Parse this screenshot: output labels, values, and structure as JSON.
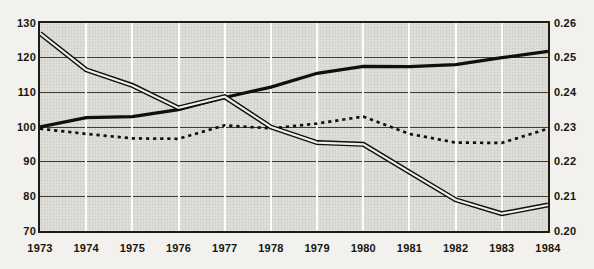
{
  "chart_data": {
    "type": "line",
    "title": "Nine small European countries",
    "title_footnote": "b",
    "x_labels": [
      "1973",
      "1974",
      "1975",
      "1976",
      "1977",
      "1978",
      "1979",
      "1980",
      "1981",
      "1982",
      "1983",
      "1984"
    ],
    "left_axis": {
      "min": 70,
      "max": 130,
      "ticks_top_to_bottom": [
        "130",
        "120",
        "110",
        "100",
        "90",
        "80",
        "70"
      ]
    },
    "right_axis": {
      "min": 0.2,
      "max": 0.26,
      "ticks_top_to_bottom": [
        "0.26",
        "0.25",
        "0.24",
        "0.23",
        "0.22",
        "0.21",
        "0.20"
      ]
    },
    "axes_alignment": "left index 100 aligns with right 0.23; 10 index points = 0.01 on right scale",
    "grid": {
      "horizontal_dark_lines": true,
      "vertical_white_lines_at_years": true,
      "plot_background": "stippled gray"
    },
    "series": [
      {
        "name": "declining-double-line",
        "style": "double-outline",
        "axis": "left",
        "values": [
          127,
          116.5,
          112,
          105.5,
          108.7,
          100,
          95.5,
          95,
          87,
          79,
          75,
          77.5
        ]
      },
      {
        "name": "rising-solid-line",
        "style": "solid-bold",
        "axis": "right",
        "values": [
          0.23,
          0.2327,
          0.233,
          0.235,
          0.2385,
          0.2415,
          0.2455,
          0.2475,
          0.2474,
          0.248,
          0.25,
          0.2518
        ],
        "values_left_equivalent": [
          100,
          102.7,
          103,
          105,
          108.5,
          111.5,
          115.5,
          117.5,
          117.4,
          118,
          120,
          121.8
        ]
      },
      {
        "name": "dotted-line",
        "style": "dotted",
        "axis": "left",
        "values": [
          99.5,
          98,
          96.7,
          96.6,
          100.5,
          99.6,
          101,
          103,
          98,
          95.5,
          95.4,
          99.5
        ]
      }
    ],
    "colors": {
      "line": "#0f0f0c",
      "double_line_core": "#f0efeb",
      "plot_fill": "#dddcd7",
      "grid_dark": "#3c3b37",
      "grid_white": "#fdfdfa",
      "page": "#f2f1ed"
    }
  }
}
